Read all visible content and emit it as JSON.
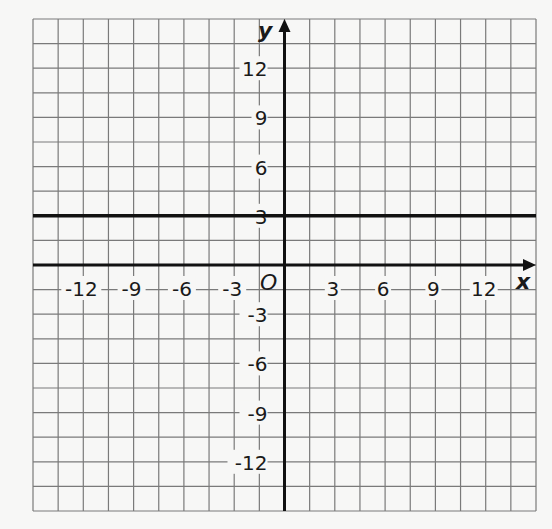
{
  "chart_data": {
    "type": "line",
    "title": "",
    "xlabel": "x",
    "ylabel": "y",
    "origin_label": "O",
    "xlim": [
      -15,
      15
    ],
    "ylim": [
      -15,
      15
    ],
    "grid": true,
    "grid_step": 1.5,
    "x_ticks": [
      -12,
      -9,
      -6,
      -3,
      3,
      6,
      9,
      12
    ],
    "y_ticks": [
      12,
      9,
      6,
      3,
      -3,
      -6,
      -9,
      -12
    ],
    "x_tick_labels": [
      "-12",
      "-9",
      "-6",
      "-3",
      "3",
      "6",
      "9",
      "12"
    ],
    "y_tick_labels": [
      "12",
      "9",
      "6",
      "3",
      "-3",
      "-6",
      "-9",
      "-12"
    ],
    "series": [
      {
        "name": "y = 3",
        "kind": "horizontal-line",
        "x": [
          -15,
          15
        ],
        "y": [
          3,
          3
        ]
      }
    ],
    "legend": null
  },
  "colors": {
    "background": "#f7f7f6",
    "grid": "#7a7a7a",
    "axis": "#111111",
    "line": "#111111"
  }
}
